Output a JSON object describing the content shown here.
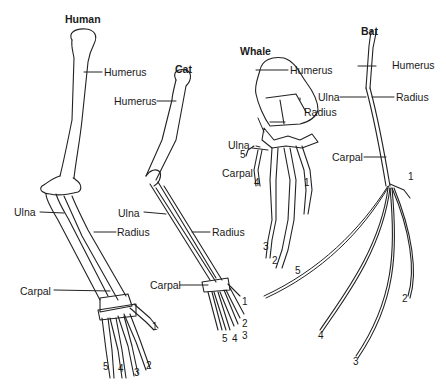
{
  "diagram": {
    "type": "homologous-forelimb-comparison",
    "specimens": [
      {
        "name": "Human",
        "labels": {
          "humerus": "Humerus",
          "ulna": "Ulna",
          "radius": "Radius",
          "carpal": "Carpal"
        },
        "digits": [
          "1",
          "2",
          "3",
          "4",
          "5"
        ]
      },
      {
        "name": "Cat",
        "labels": {
          "humerus": "Humerus",
          "ulna": "Ulna",
          "radius": "Radius",
          "carpal": "Carpal"
        },
        "digits": [
          "1",
          "2",
          "3",
          "4",
          "5"
        ]
      },
      {
        "name": "Whale",
        "labels": {
          "humerus": "Humerus",
          "ulna": "Ulna",
          "radius": "Radius",
          "carpal": "Carpal"
        },
        "digits": [
          "1",
          "2",
          "3",
          "4",
          "5"
        ]
      },
      {
        "name": "Bat",
        "labels": {
          "humerus": "Humerus",
          "ulna": "Ulna",
          "radius": "Radius",
          "carpal": "Carpal"
        },
        "digits": [
          "1",
          "2",
          "3",
          "4",
          "5"
        ]
      }
    ]
  }
}
